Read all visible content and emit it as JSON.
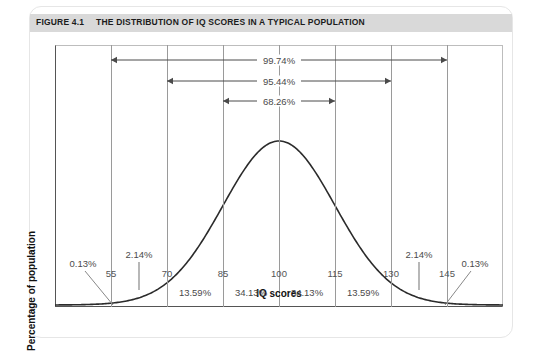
{
  "figure": {
    "number_label": "FIGURE 4.1",
    "title": "THE DISTRIBUTION OF IQ SCORES IN A TYPICAL POPULATION"
  },
  "chart_data": {
    "type": "line",
    "title": "THE DISTRIBUTION OF IQ SCORES IN A TYPICAL POPULATION",
    "xlabel": "IQ scores",
    "ylabel": "Percentage of population",
    "xlim": [
      40,
      160
    ],
    "ylim": [
      0,
      1
    ],
    "grid": true,
    "legend_position": "none",
    "distribution": {
      "name": "normal",
      "mean": 100,
      "std_dev": 15
    },
    "xticks": [
      55,
      70,
      85,
      100,
      115,
      130,
      145
    ],
    "xtick_labels": [
      "55",
      "70",
      "85",
      "100",
      "115",
      "130",
      "145"
    ],
    "segment_percentages": [
      {
        "label": "0.13%",
        "range": [
          40,
          55
        ],
        "center": 47.5
      },
      {
        "label": "2.14%",
        "range": [
          55,
          70
        ],
        "center": 62.5
      },
      {
        "label": "13.59%",
        "range": [
          70,
          85
        ],
        "center": 77.5
      },
      {
        "label": "34.13%",
        "range": [
          85,
          100
        ],
        "center": 92.5
      },
      {
        "label": "34.13%",
        "range": [
          100,
          115
        ],
        "center": 107.5
      },
      {
        "label": "13.59%",
        "range": [
          115,
          130
        ],
        "center": 122.5
      },
      {
        "label": "2.14%",
        "range": [
          130,
          145
        ],
        "center": 137.5
      },
      {
        "label": "0.13%",
        "range": [
          145,
          160
        ],
        "center": 152.5
      }
    ],
    "range_annotations": [
      {
        "label": "99.74%",
        "from": 55,
        "to": 145,
        "sigma": 3
      },
      {
        "label": "95.44%",
        "from": 70,
        "to": 130,
        "sigma": 2
      },
      {
        "label": "68.26%",
        "from": 85,
        "to": 115,
        "sigma": 1
      }
    ]
  },
  "colors": {
    "title_band": "#d9d9d9",
    "curve": "#2b2b2b",
    "gridline": "#9a9a9a",
    "text": "#4a4a4a",
    "axis": "#555555"
  }
}
